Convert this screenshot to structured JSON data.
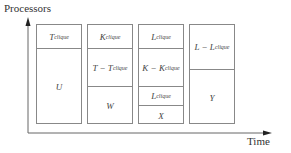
{
  "axes": {
    "y_label": "Processors",
    "x_label": "Time"
  },
  "columns": [
    {
      "id": "col1",
      "cells": [
        {
          "main": "T",
          "sub": "clique",
          "rest": ""
        },
        {
          "main": "U",
          "sub": "",
          "rest": ""
        }
      ]
    },
    {
      "id": "col2",
      "cells": [
        {
          "main": "K",
          "sub": "clique",
          "rest": ""
        },
        {
          "main": "T − T",
          "sub": "clique",
          "rest": ""
        },
        {
          "main": "W",
          "sub": "",
          "rest": ""
        }
      ]
    },
    {
      "id": "col3",
      "cells": [
        {
          "main": "L",
          "sub": "clique",
          "rest": ""
        },
        {
          "main": "K − K",
          "sub": "clique",
          "rest": ""
        },
        {
          "main": "L",
          "sub": "clique",
          "rest": ""
        },
        {
          "main": "X",
          "sub": "",
          "rest": ""
        }
      ]
    },
    {
      "id": "col4",
      "cells": [
        {
          "main": "L − L",
          "sub": "clique",
          "rest": ""
        },
        {
          "main": "Y",
          "sub": "",
          "rest": ""
        }
      ]
    }
  ]
}
